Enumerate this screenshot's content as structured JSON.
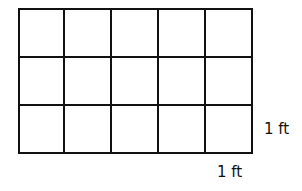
{
  "diagram": {
    "type": "area-grid",
    "rows": 3,
    "columns": 5,
    "square_count": 15,
    "unit_side_label": "1 ft",
    "side_label_right": "1 ft",
    "side_label_bottom": "1 ft",
    "line_color": "#111111",
    "background": "#ffffff"
  }
}
